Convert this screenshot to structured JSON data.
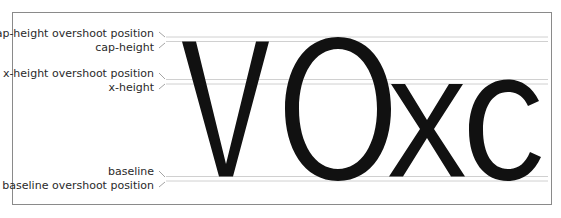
{
  "diagram": {
    "specimen_text": "VOxc",
    "labels": {
      "cap_overshoot": "cap-height overshoot position",
      "cap_height": "cap-height",
      "x_overshoot": "x-height overshoot position",
      "x_height": "x-height",
      "baseline": "baseline",
      "baseline_overshoot": "baseline overshoot position"
    },
    "colors": {
      "glyph": "#111111",
      "guide": "#bdbdbd",
      "frame": "#8a8a8a",
      "label": "#2a2a2a"
    }
  }
}
